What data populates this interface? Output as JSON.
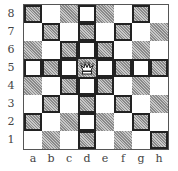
{
  "board": {
    "files": [
      "a",
      "b",
      "c",
      "d",
      "e",
      "f",
      "g",
      "h"
    ],
    "ranks": [
      "8",
      "7",
      "6",
      "5",
      "4",
      "3",
      "2",
      "1"
    ],
    "colors": {
      "light": "#ffffff",
      "dark": "#bdbdbd",
      "highlight_border": "#222222"
    },
    "pieces": [
      {
        "square": "d5",
        "piece": "queen",
        "color": "white",
        "glyph": "♕"
      }
    ],
    "highlighted_squares": [
      "a8",
      "d8",
      "g8",
      "b7",
      "d7",
      "f7",
      "c6",
      "d6",
      "e6",
      "a5",
      "b5",
      "c5",
      "e5",
      "f5",
      "g5",
      "h5",
      "c4",
      "d4",
      "e4",
      "b3",
      "d3",
      "f3",
      "a2",
      "d2",
      "g2",
      "d1",
      "h1"
    ]
  }
}
